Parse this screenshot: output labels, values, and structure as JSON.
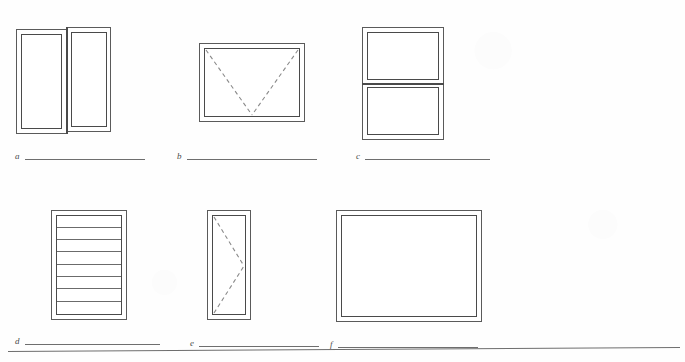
{
  "figure": {
    "type": "line-drawing-plate",
    "background_color": "#fefefe",
    "line_color": "#5a5a5a",
    "dashed_line_color": "#8a8a8a",
    "page_rule": {
      "present": true
    }
  },
  "items": [
    {
      "id": "a",
      "label": "a",
      "window_type": "sliding",
      "blank_rule": true,
      "frame": {
        "x": 16,
        "y": 27,
        "w": 95,
        "h": 107
      },
      "panes": 2,
      "divider_orientation": "vertical",
      "dashed_lines": []
    },
    {
      "id": "b",
      "label": "b",
      "window_type": "awning",
      "blank_rule": true,
      "frame": {
        "x": 199,
        "y": 43,
        "w": 106,
        "h": 79
      },
      "panes": 1,
      "divider_orientation": "none",
      "dashed_lines": [
        "top-left-to-bottom-center",
        "top-right-to-bottom-center"
      ]
    },
    {
      "id": "c",
      "label": "c",
      "window_type": "double-hung",
      "blank_rule": true,
      "frame": {
        "x": 362,
        "y": 27,
        "w": 82,
        "h": 113
      },
      "panes": 2,
      "divider_orientation": "horizontal",
      "dashed_lines": []
    },
    {
      "id": "d",
      "label": "d",
      "window_type": "jalousie",
      "blank_rule": true,
      "frame": {
        "x": 51,
        "y": 210,
        "w": 76,
        "h": 110
      },
      "panes": 8,
      "slat_count": 7,
      "divider_orientation": "horizontal",
      "dashed_lines": []
    },
    {
      "id": "e",
      "label": "e",
      "window_type": "casement",
      "blank_rule": true,
      "frame": {
        "x": 207,
        "y": 210,
        "w": 44,
        "h": 110
      },
      "panes": 1,
      "divider_orientation": "none",
      "dashed_lines": [
        "top-left-to-right-center",
        "bottom-left-to-right-center"
      ]
    },
    {
      "id": "f",
      "label": "f",
      "window_type": "fixed",
      "blank_rule": true,
      "frame": {
        "x": 336,
        "y": 210,
        "w": 146,
        "h": 112
      },
      "panes": 1,
      "divider_orientation": "none",
      "dashed_lines": []
    }
  ],
  "captions": [
    {
      "letter": "a",
      "x": 15,
      "y": 152,
      "rule_width": 120
    },
    {
      "letter": "b",
      "x": 177,
      "y": 152,
      "rule_width": 130
    },
    {
      "letter": "c",
      "x": 356,
      "y": 152,
      "rule_width": 125
    },
    {
      "letter": "d",
      "x": 15,
      "y": 337,
      "rule_width": 135
    },
    {
      "letter": "e",
      "x": 190,
      "y": 339,
      "rule_width": 120
    },
    {
      "letter": "f",
      "x": 330,
      "y": 340,
      "rule_width": 140
    }
  ]
}
